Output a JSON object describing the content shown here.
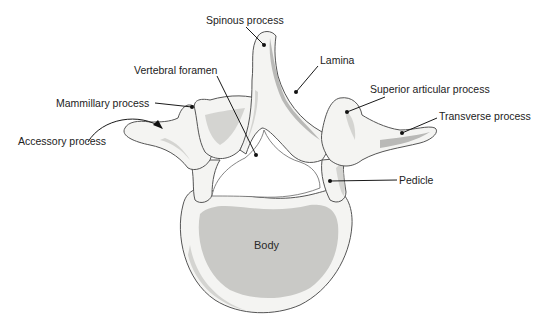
{
  "figure": {
    "labels": {
      "spinous_process": "Spinous process",
      "lamina": "Lamina",
      "vertebral_foramen": "Vertebral  foramen",
      "superior_articular_process": "Superior articular process",
      "mammillary_process": "Mammillary process",
      "transverse_process": "Transverse process",
      "accessory_process": "Accessory process",
      "pedicle": "Pedicle",
      "body": "Body"
    }
  }
}
